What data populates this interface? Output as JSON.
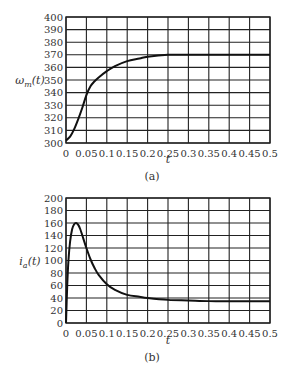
{
  "chart_data": [
    {
      "type": "line",
      "panel": "(a)",
      "title": "",
      "xlabel": "t",
      "ylabel": "ω_m(t)",
      "ylabel_main": "ω",
      "ylabel_sub": "m",
      "ylabel_tail": "(t)",
      "caption": "(a)",
      "xlim": [
        0,
        0.5
      ],
      "ylim": [
        300,
        400
      ],
      "grid": true,
      "x_ticks": [
        "0",
        "0.05",
        "0.1",
        "0.15",
        "0.2",
        "0.25",
        "0.3",
        "0.35",
        "0.4",
        "0.45",
        "0.5"
      ],
      "y_ticks": [
        "300",
        "310",
        "320",
        "330",
        "340",
        "350",
        "360",
        "370",
        "380",
        "390",
        "400"
      ],
      "series": [
        {
          "name": "ω_m(t)",
          "x": [
            0,
            0.01,
            0.02,
            0.03,
            0.04,
            0.05,
            0.06,
            0.07,
            0.08,
            0.1,
            0.12,
            0.15,
            0.18,
            0.2,
            0.25,
            0.3,
            0.35,
            0.4,
            0.45,
            0.5
          ],
          "y": [
            302,
            305,
            311,
            319,
            328,
            338,
            345,
            349,
            352,
            357,
            361,
            365,
            367,
            368.5,
            370,
            370,
            370,
            370,
            370,
            370
          ]
        }
      ]
    },
    {
      "type": "line",
      "panel": "(b)",
      "title": "",
      "xlabel": "t",
      "ylabel": "i_a(t)",
      "ylabel_main": "i",
      "ylabel_sub": "a",
      "ylabel_tail": "(t)",
      "caption": "(b)",
      "xlim": [
        0,
        0.5
      ],
      "ylim": [
        0,
        200
      ],
      "grid": true,
      "x_ticks": [
        "0",
        "0.05",
        "0.1",
        "0.15",
        "0.2",
        "0.25",
        "0.3",
        "0.35",
        "0.4",
        "0.45",
        "0.5"
      ],
      "y_ticks": [
        "0",
        "20",
        "40",
        "60",
        "80",
        "100",
        "120",
        "140",
        "160",
        "180",
        "200"
      ],
      "series": [
        {
          "name": "i_a(t)",
          "x": [
            0,
            0.003,
            0.006,
            0.01,
            0.015,
            0.02,
            0.025,
            0.03,
            0.035,
            0.04,
            0.05,
            0.06,
            0.07,
            0.08,
            0.1,
            0.12,
            0.15,
            0.18,
            0.2,
            0.25,
            0.3,
            0.35,
            0.4,
            0.45,
            0.5
          ],
          "y": [
            0,
            60,
            100,
            130,
            150,
            158,
            160,
            157,
            150,
            140,
            120,
            102,
            88,
            77,
            62,
            53,
            45,
            42,
            40,
            37,
            36,
            35,
            35,
            35,
            35
          ]
        }
      ]
    }
  ]
}
